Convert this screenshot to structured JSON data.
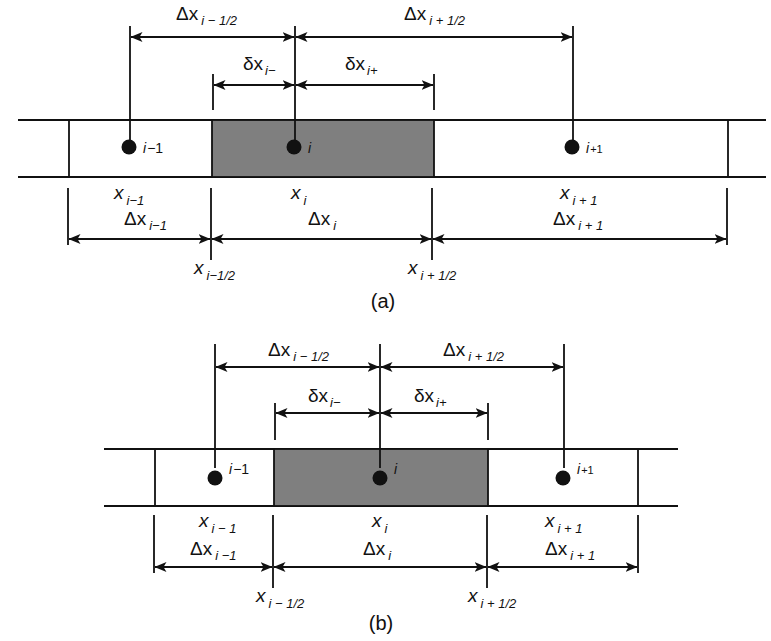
{
  "figure": {
    "colors": {
      "shaded_cell": "#7f7f7f",
      "lines": "#111111",
      "background": "#ffffff"
    }
  },
  "panels": [
    {
      "caption": "(a)",
      "nodes": [
        {
          "id": "i-1",
          "label": "i",
          "sub": "−1"
        },
        {
          "id": "i",
          "label": "i",
          "sub": ""
        },
        {
          "id": "i+1",
          "label": "i",
          "sub": "+1"
        }
      ],
      "top_dims": {
        "dx_minus_half": {
          "main": "Δx",
          "sub": "i − 1/2"
        },
        "dx_plus_half": {
          "main": "Δx",
          "sub": "i + 1/2"
        },
        "delta_minus": {
          "main": "δx",
          "sub": "i−"
        },
        "delta_plus": {
          "main": "δx",
          "sub": "i+"
        }
      },
      "positions": {
        "x_im1": {
          "main": "x",
          "sub": "i−1"
        },
        "x_i": {
          "main": "x",
          "sub": "i"
        },
        "x_ip1": {
          "main": "x",
          "sub": "i + 1"
        }
      },
      "bottom_dims": {
        "dx_im1": {
          "main": "Δx",
          "sub": "i−1"
        },
        "dx_i": {
          "main": "Δx",
          "sub": "i"
        },
        "dx_ip1": {
          "main": "Δx",
          "sub": "i + 1"
        }
      },
      "faces": {
        "x_im_half": {
          "main": "x",
          "sub": "i−1/2"
        },
        "x_ip_half": {
          "main": "x",
          "sub": "i + 1/2"
        }
      }
    },
    {
      "caption": "(b)",
      "nodes": [
        {
          "id": "i-1",
          "label": "i",
          "sub": "−1"
        },
        {
          "id": "i",
          "label": "i",
          "sub": ""
        },
        {
          "id": "i+1",
          "label": "i",
          "sub": "+1"
        }
      ],
      "top_dims": {
        "dx_minus_half": {
          "main": "Δx",
          "sub": "i − 1/2"
        },
        "dx_plus_half": {
          "main": "Δx",
          "sub": "i + 1/2"
        },
        "delta_minus": {
          "main": "δx",
          "sub": "i−"
        },
        "delta_plus": {
          "main": "δx",
          "sub": "i+"
        }
      },
      "positions": {
        "x_im1": {
          "main": "x",
          "sub": "i − 1"
        },
        "x_i": {
          "main": "x",
          "sub": "i"
        },
        "x_ip1": {
          "main": "x",
          "sub": "i + 1"
        }
      },
      "bottom_dims": {
        "dx_im1": {
          "main": "Δx",
          "sub": "i −1"
        },
        "dx_i": {
          "main": "Δx",
          "sub": "i"
        },
        "dx_ip1": {
          "main": "Δx",
          "sub": "i + 1"
        }
      },
      "faces": {
        "x_im_half": {
          "main": "x",
          "sub": "i − 1/2"
        },
        "x_ip_half": {
          "main": "x",
          "sub": "i + 1/2"
        }
      }
    }
  ]
}
